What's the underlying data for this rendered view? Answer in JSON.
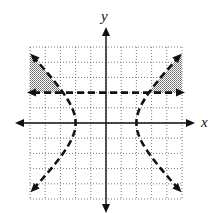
{
  "chart_data": {
    "type": "line",
    "title": "",
    "xlabel": "x",
    "ylabel": "y",
    "xlim": [
      -5,
      5
    ],
    "ylim": [
      -5,
      5
    ],
    "grid": true,
    "grid_style": "dotted",
    "grid_step": 1,
    "tick_labels": false,
    "series": [
      {
        "name": "hyperbola x^2/4 - y^2/4 = 1",
        "style": "dashed",
        "kind": "boundary",
        "branches": [
          {
            "side": "left",
            "vertex": [
              -2,
              0
            ],
            "endpoints": [
              [
                -5,
                4.58
              ],
              [
                -5,
                -4.58
              ]
            ]
          },
          {
            "side": "right",
            "vertex": [
              2,
              0
            ],
            "endpoints": [
              [
                5,
                4.58
              ],
              [
                5,
                -4.58
              ]
            ]
          }
        ]
      },
      {
        "name": "horizontal line y = 2",
        "style": "dashed",
        "kind": "boundary",
        "points": [
          [
            -5,
            2
          ],
          [
            5,
            2
          ]
        ]
      }
    ],
    "shaded_regions": [
      {
        "description": "left region above y=2 and left of hyperbola",
        "vertices_approx": [
          [
            -5,
            2
          ],
          [
            -2.83,
            2
          ],
          [
            -5,
            4.58
          ]
        ]
      },
      {
        "description": "right region above y=2 and right of hyperbola",
        "vertices_approx": [
          [
            5,
            2
          ],
          [
            2.83,
            2
          ],
          [
            5,
            4.58
          ]
        ]
      }
    ]
  },
  "labels": {
    "x": "x",
    "y": "y"
  },
  "colors": {
    "ink": "#111111",
    "grid": "#555555",
    "shade": "#9a9a9a"
  }
}
